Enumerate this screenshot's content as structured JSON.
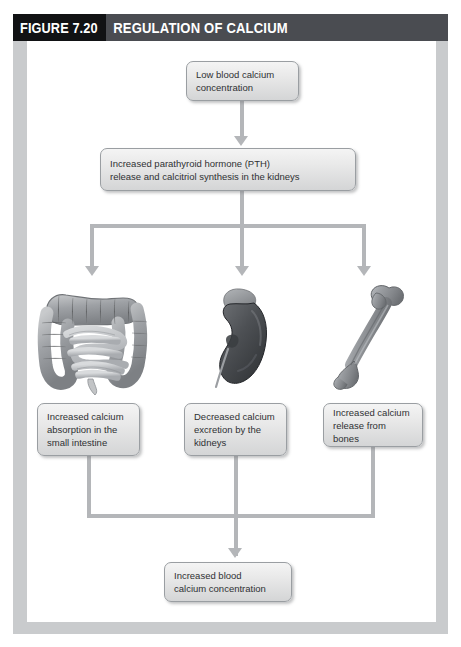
{
  "header": {
    "figure_number": "FIGURE 7.20",
    "title": "REGULATION OF CALCIUM",
    "number_bg": "#111214",
    "title_bg": "#4a4c51",
    "text_color": "#ffffff"
  },
  "palette": {
    "page_frame": "#c9cbcd",
    "canvas": "#ffffff",
    "box_fill_top": "#f4f4f4",
    "box_fill_bottom": "#d4d5d6",
    "box_border": "#9a9ea2",
    "connector": "#b4b6b9",
    "text": "#2f3133"
  },
  "flow": {
    "boxes": [
      {
        "id": "low-calcium",
        "lines": [
          "Low blood calcium",
          "concentration"
        ]
      },
      {
        "id": "pth",
        "lines": [
          "Increased parathyroid hormone (PTH)",
          "release and calcitriol synthesis in the kidneys"
        ]
      },
      {
        "id": "intestine-effect",
        "lines": [
          "Increased calcium",
          "absorption in the",
          "small intestine"
        ]
      },
      {
        "id": "kidney-effect",
        "lines": [
          "Decreased calcium",
          "excretion by the",
          "kidneys"
        ]
      },
      {
        "id": "bone-effect",
        "lines": [
          "Increased calcium",
          "release from bones"
        ]
      },
      {
        "id": "increased-calcium",
        "lines": [
          "Increased blood",
          "calcium concentration"
        ]
      }
    ]
  },
  "illustrations": [
    {
      "id": "intestine",
      "icon": "intestine-illustration",
      "label": "small and large intestine"
    },
    {
      "id": "kidney",
      "icon": "kidney-illustration",
      "label": "kidney with adrenal gland"
    },
    {
      "id": "bone",
      "icon": "bone-illustration",
      "label": "femur bone"
    }
  ],
  "connectors": [
    {
      "id": "low-calcium-to-pth",
      "type": "arrow-down"
    },
    {
      "id": "pth-to-organs",
      "type": "branch-down-three"
    },
    {
      "id": "organs-to-increased",
      "type": "merge-down-one"
    }
  ]
}
